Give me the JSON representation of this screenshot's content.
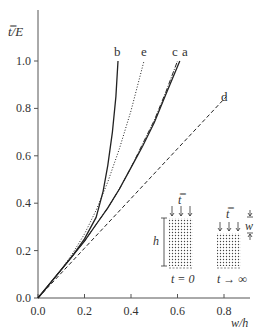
{
  "chart_data": {
    "type": "line",
    "title": "",
    "xlabel": "w/h",
    "ylabel": "t̿/E",
    "xlim": [
      0,
      0.9
    ],
    "ylim": [
      0,
      1.1
    ],
    "xticks": [
      "0.0",
      "0.2",
      "0.4",
      "0.6",
      "0.8"
    ],
    "yticks": [
      "0.0",
      "0.2",
      "0.4",
      "0.6",
      "0.8",
      "1.0"
    ],
    "grid": false,
    "legend": "curve labels placed at line ends",
    "series": [
      {
        "name": "a",
        "style": "solid",
        "x": [
          0,
          0.05,
          0.1,
          0.15,
          0.2,
          0.25,
          0.3,
          0.35,
          0.4,
          0.45,
          0.5,
          0.55,
          0.61
        ],
        "y": [
          0,
          0.06,
          0.12,
          0.18,
          0.24,
          0.31,
          0.38,
          0.46,
          0.55,
          0.64,
          0.74,
          0.86,
          1.0
        ]
      },
      {
        "name": "b",
        "style": "solid",
        "x": [
          0,
          0.05,
          0.1,
          0.15,
          0.2,
          0.25,
          0.28,
          0.3,
          0.32,
          0.335,
          0.344
        ],
        "y": [
          0,
          0.06,
          0.12,
          0.18,
          0.25,
          0.34,
          0.45,
          0.56,
          0.7,
          0.85,
          1.0
        ]
      },
      {
        "name": "c",
        "style": "dash-dot",
        "x": [
          0,
          0.05,
          0.1,
          0.15,
          0.2,
          0.25,
          0.3,
          0.35,
          0.4,
          0.45,
          0.5,
          0.55,
          0.6
        ],
        "y": [
          0,
          0.06,
          0.12,
          0.18,
          0.24,
          0.31,
          0.38,
          0.46,
          0.55,
          0.65,
          0.75,
          0.87,
          1.0
        ]
      },
      {
        "name": "d",
        "style": "dashed",
        "x": [
          0,
          0.2,
          0.4,
          0.6,
          0.81
        ],
        "y": [
          0,
          0.21,
          0.42,
          0.63,
          0.85
        ]
      },
      {
        "name": "e",
        "style": "dotted",
        "x": [
          0,
          0.05,
          0.1,
          0.15,
          0.2,
          0.25,
          0.3,
          0.35,
          0.4,
          0.456
        ],
        "y": [
          0,
          0.06,
          0.12,
          0.19,
          0.27,
          0.37,
          0.49,
          0.63,
          0.79,
          1.0
        ]
      }
    ],
    "annotations": {
      "curve_labels": [
        "a",
        "b",
        "c",
        "d",
        "e"
      ],
      "inset_left": {
        "load": "t̿",
        "height": "h",
        "time": "t = 0"
      },
      "inset_right": {
        "load": "t̿",
        "displacement": "w",
        "time": "t → ∞"
      }
    }
  },
  "labels": {
    "ylabel": "t̿/E",
    "xlabel": "w/h",
    "curve_a": "a",
    "curve_b": "b",
    "curve_c": "c",
    "curve_d": "d",
    "curve_e": "e",
    "inset_load_left": "t̿",
    "inset_load_right": "t̿",
    "inset_h": "h",
    "inset_w": "w",
    "inset_t0": "t = 0",
    "inset_tinf": "t → ∞"
  },
  "colors": {
    "axis": "#555555",
    "line": "#222222",
    "text": "#333333"
  }
}
